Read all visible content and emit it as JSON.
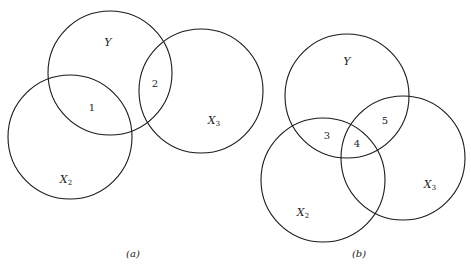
{
  "panels": [
    {
      "caption": "(a)",
      "circles": [
        {
          "name": "Y",
          "cx": 110,
          "cy": 73,
          "r": 62,
          "label": "Y",
          "sub": "",
          "lx": 108,
          "ly": 46
        },
        {
          "name": "X2",
          "cx": 70,
          "cy": 137,
          "r": 62,
          "label": "X",
          "sub": "2",
          "lx": 66,
          "ly": 183
        },
        {
          "name": "X3",
          "cx": 201,
          "cy": 91,
          "r": 62,
          "label": "X",
          "sub": "3",
          "lx": 214,
          "ly": 124
        }
      ],
      "regions": [
        {
          "label": "1",
          "x": 92,
          "y": 111
        },
        {
          "label": "2",
          "x": 155,
          "y": 87
        }
      ],
      "caption_x": 133,
      "caption_y": 257
    },
    {
      "caption": "(b)",
      "circles": [
        {
          "name": "Y",
          "cx": 347,
          "cy": 96,
          "r": 62,
          "label": "Y",
          "sub": "",
          "lx": 347,
          "ly": 65
        },
        {
          "name": "X2",
          "cx": 323,
          "cy": 180,
          "r": 62,
          "label": "X",
          "sub": "2",
          "lx": 303,
          "ly": 216
        },
        {
          "name": "X3",
          "cx": 403,
          "cy": 158,
          "r": 62,
          "label": "X",
          "sub": "3",
          "lx": 430,
          "ly": 188
        }
      ],
      "regions": [
        {
          "label": "3",
          "x": 327,
          "y": 139
        },
        {
          "label": "4",
          "x": 357,
          "y": 147
        },
        {
          "label": "5",
          "x": 385,
          "y": 124
        }
      ],
      "caption_x": 359,
      "caption_y": 257
    }
  ]
}
